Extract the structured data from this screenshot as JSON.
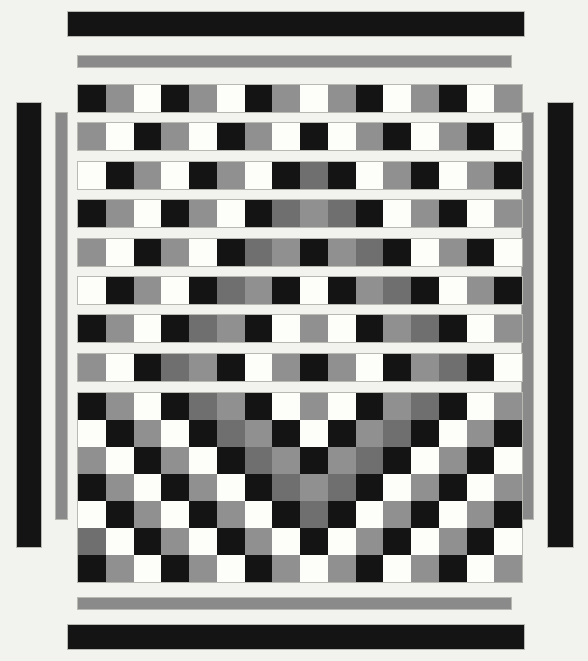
{
  "canvas": {
    "width": 588,
    "height": 661,
    "background": "#f2f2ee"
  },
  "palette": {
    "black": "#141414",
    "white": "#fdfdfa",
    "gray": "#909090",
    "dark_gray": "#6f6f6f",
    "bar_gray": "#8a8a8a",
    "outline": "#b9b9b4"
  },
  "geometry": {
    "grid_left": 77,
    "grid_right": 521,
    "columns": 16,
    "cell_size": 27.75,
    "row_height": 27,
    "row_gap": 11.5
  },
  "decor_bars": [
    {
      "name": "top-black-bar",
      "color_key": "black",
      "x": 67,
      "y": 11,
      "w": 458,
      "h": 26
    },
    {
      "name": "top-gray-bar",
      "color_key": "bar_gray",
      "x": 77,
      "y": 55,
      "w": 435,
      "h": 13
    },
    {
      "name": "left-black-bar",
      "color_key": "black",
      "x": 16,
      "y": 102,
      "w": 26,
      "h": 446
    },
    {
      "name": "left-gray-bar",
      "color_key": "bar_gray",
      "x": 55,
      "y": 112,
      "w": 13,
      "h": 408
    },
    {
      "name": "right-gray-bar",
      "color_key": "bar_gray",
      "x": 521,
      "y": 112,
      "w": 13,
      "h": 408
    },
    {
      "name": "right-black-bar",
      "color_key": "black",
      "x": 547,
      "y": 102,
      "w": 27,
      "h": 446
    },
    {
      "name": "bottom-gray-bar",
      "color_key": "bar_gray",
      "x": 77,
      "y": 597,
      "w": 435,
      "h": 13
    },
    {
      "name": "bottom-black-bar",
      "color_key": "black",
      "x": 67,
      "y": 624,
      "w": 458,
      "h": 26
    }
  ],
  "separated_rows": [
    {
      "y": 84,
      "cells": [
        "black",
        "gray",
        "white",
        "black",
        "gray",
        "white",
        "black",
        "gray",
        "white",
        "gray",
        "black",
        "white",
        "gray",
        "black",
        "white",
        "gray",
        "black"
      ]
    },
    {
      "y": 122,
      "cells": [
        "gray",
        "white",
        "black",
        "gray",
        "white",
        "black",
        "gray",
        "white",
        "black",
        "white",
        "gray",
        "black",
        "white",
        "gray",
        "black",
        "white",
        "gray"
      ]
    },
    {
      "y": 161,
      "cells": [
        "white",
        "black",
        "gray",
        "white",
        "black",
        "gray",
        "white",
        "black",
        "dark_gray",
        "black",
        "white",
        "gray",
        "black",
        "white",
        "gray",
        "black",
        "white"
      ]
    },
    {
      "y": 199,
      "cells": [
        "black",
        "gray",
        "white",
        "black",
        "gray",
        "white",
        "black",
        "dark_gray",
        "gray",
        "dark_gray",
        "black",
        "white",
        "gray",
        "black",
        "white",
        "gray",
        "black"
      ]
    },
    {
      "y": 238,
      "cells": [
        "gray",
        "white",
        "black",
        "gray",
        "white",
        "black",
        "dark_gray",
        "gray",
        "black",
        "gray",
        "dark_gray",
        "black",
        "white",
        "gray",
        "black",
        "white",
        "gray"
      ]
    },
    {
      "y": 276,
      "cells": [
        "white",
        "black",
        "gray",
        "white",
        "black",
        "dark_gray",
        "gray",
        "black",
        "white",
        "black",
        "gray",
        "dark_gray",
        "black",
        "white",
        "gray",
        "black",
        "white"
      ]
    },
    {
      "y": 314,
      "cells": [
        "black",
        "gray",
        "white",
        "black",
        "dark_gray",
        "gray",
        "black",
        "white",
        "gray",
        "white",
        "black",
        "gray",
        "dark_gray",
        "black",
        "white",
        "gray",
        "black"
      ]
    },
    {
      "y": 353,
      "cells": [
        "gray",
        "white",
        "black",
        "dark_gray",
        "gray",
        "black",
        "white",
        "gray",
        "black",
        "gray",
        "white",
        "black",
        "gray",
        "dark_gray",
        "black",
        "white",
        "gray"
      ]
    }
  ],
  "block_grid": {
    "y": 392,
    "rows": [
      [
        "black",
        "gray",
        "white",
        "black",
        "dark_gray",
        "gray",
        "black",
        "white",
        "gray",
        "white",
        "black",
        "gray",
        "dark_gray",
        "black",
        "white",
        "gray",
        "black"
      ],
      [
        "white",
        "black",
        "gray",
        "white",
        "black",
        "dark_gray",
        "gray",
        "black",
        "white",
        "black",
        "gray",
        "dark_gray",
        "black",
        "white",
        "gray",
        "black",
        "white"
      ],
      [
        "gray",
        "white",
        "black",
        "gray",
        "white",
        "black",
        "dark_gray",
        "gray",
        "black",
        "gray",
        "dark_gray",
        "black",
        "white",
        "gray",
        "black",
        "white",
        "gray"
      ],
      [
        "black",
        "gray",
        "white",
        "black",
        "gray",
        "white",
        "black",
        "dark_gray",
        "gray",
        "dark_gray",
        "black",
        "white",
        "gray",
        "black",
        "white",
        "gray",
        "black"
      ],
      [
        "white",
        "black",
        "gray",
        "white",
        "black",
        "gray",
        "white",
        "black",
        "dark_gray",
        "black",
        "white",
        "gray",
        "black",
        "white",
        "gray",
        "black",
        "white"
      ],
      [
        "dark_gray",
        "white",
        "black",
        "gray",
        "white",
        "black",
        "gray",
        "white",
        "black",
        "white",
        "gray",
        "black",
        "white",
        "gray",
        "black",
        "white",
        "dark_gray"
      ],
      [
        "black",
        "gray",
        "white",
        "black",
        "gray",
        "white",
        "black",
        "gray",
        "white",
        "gray",
        "black",
        "white",
        "gray",
        "black",
        "white",
        "gray",
        "black"
      ]
    ]
  }
}
